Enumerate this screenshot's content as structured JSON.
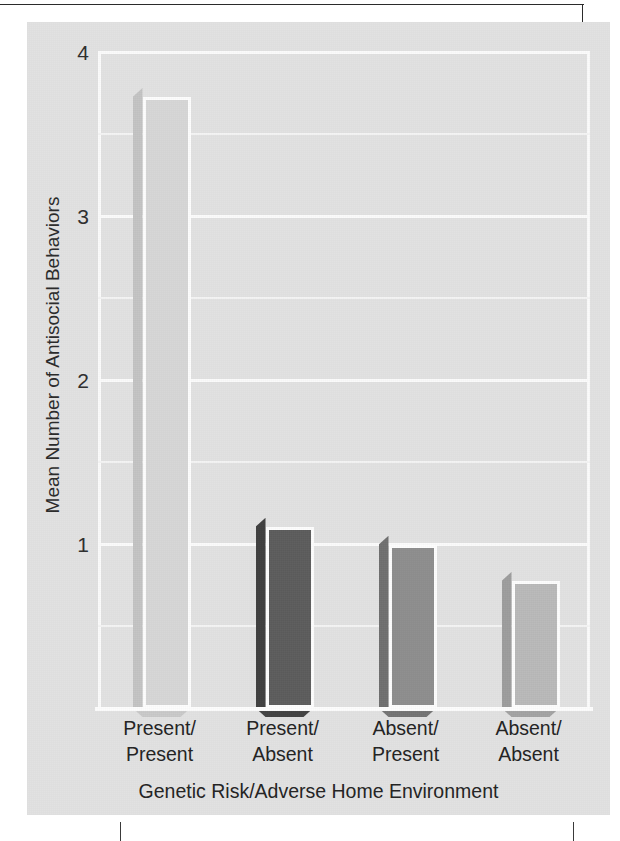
{
  "figure": {
    "background_color": "#e2e2e2",
    "plot_background_color": "#e2e2e2",
    "gridline_color": "#fbfbfb"
  },
  "axes": {
    "y_title": "Mean Number of Antisocial Behaviors",
    "x_title": "Genetic Risk/Adverse Home Environment",
    "y_ticks": [
      "4",
      "3",
      "2",
      "1"
    ],
    "y_tick_values": [
      4,
      3,
      2,
      1
    ],
    "y_min": 0,
    "y_max": 4
  },
  "x_labels": [
    {
      "line1": "Present/",
      "line2": "Present"
    },
    {
      "line1": "Present/",
      "line2": "Absent"
    },
    {
      "line1": "Absent/",
      "line2": "Present"
    },
    {
      "line1": "Absent/",
      "line2": "Absent"
    }
  ],
  "bars": [
    {
      "label": "Present/Present",
      "value": 3.78,
      "fill": "#d7d7d7",
      "side": "#c3c3c3",
      "bottom": "#c9c9c9"
    },
    {
      "label": "Present/Absent",
      "value": 1.16,
      "fill": "#5c5c5c",
      "side": "#3f3f3f",
      "bottom": "#434343"
    },
    {
      "label": "Absent/Present",
      "value": 1.05,
      "fill": "#8e8e8e",
      "side": "#6f6f6f",
      "bottom": "#747474"
    },
    {
      "label": "Absent/Absent",
      "value": 0.83,
      "fill": "#b9b9b9",
      "side": "#9d9d9d",
      "bottom": "#a3a3a3"
    }
  ],
  "chart_data": {
    "type": "bar",
    "title": "",
    "subtitle": "",
    "categories": [
      "Present/Present",
      "Present/Absent",
      "Absent/Present",
      "Absent/Absent"
    ],
    "values": [
      3.78,
      1.16,
      1.05,
      0.83
    ],
    "xlabel": "Genetic Risk/Adverse Home Environment",
    "ylabel": "Mean Number of Antisocial Behaviors",
    "ylim": [
      0,
      4
    ],
    "ytick_labels": [
      "1",
      "2",
      "3",
      "4"
    ],
    "ytick_values": [
      1,
      2,
      3,
      4
    ],
    "minor_gridlines_at": [
      0.5,
      1.5,
      2.5,
      3.5
    ],
    "grid": true,
    "legend": "none",
    "bar_colors": [
      "#d7d7d7",
      "#5c5c5c",
      "#8e8e8e",
      "#b9b9b9"
    ],
    "style": "3d-shaded-bars"
  }
}
